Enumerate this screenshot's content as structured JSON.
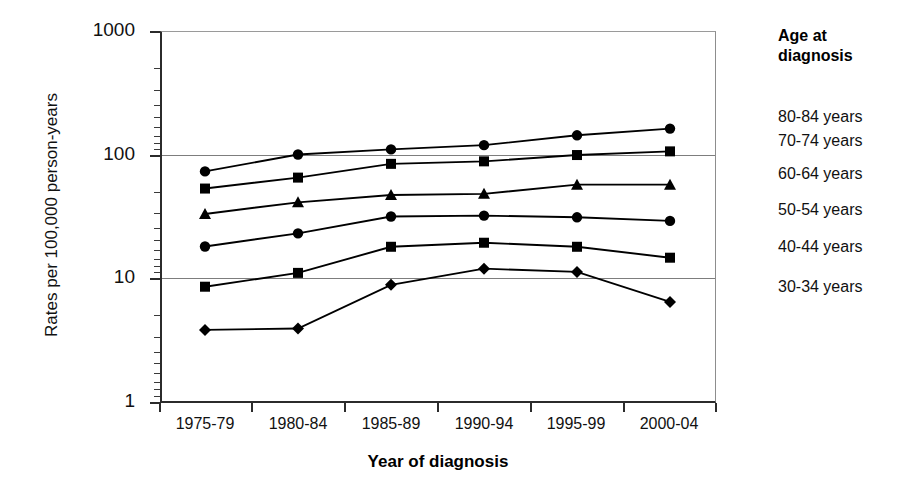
{
  "chart_data": {
    "type": "line",
    "title": "",
    "xlabel": "Year of diagnosis",
    "ylabel": "Rates per 100,000 person-years",
    "yscale": "log",
    "ylim": [
      1,
      1000
    ],
    "yticks": [
      "1000",
      "100",
      "10",
      "1"
    ],
    "grid": true,
    "legend_position": "right",
    "legend_title": "Age at diagnosis",
    "categories": [
      "1975-79",
      "1980-84",
      "1985-89",
      "1990-94",
      "1995-99",
      "2000-04"
    ],
    "series": [
      {
        "name": "80-84 years",
        "marker": "circle",
        "values": [
          73,
          100,
          110,
          119,
          143,
          162
        ]
      },
      {
        "name": "70-74 years",
        "marker": "square",
        "values": [
          53,
          65,
          84,
          88,
          99,
          106
        ]
      },
      {
        "name": "60-64 years",
        "marker": "triangle",
        "values": [
          33,
          41,
          47,
          48,
          57,
          57
        ]
      },
      {
        "name": "50-54 years",
        "marker": "circle",
        "values": [
          18,
          23,
          31.5,
          32,
          31,
          29
        ]
      },
      {
        "name": "40-44 years",
        "marker": "square",
        "values": [
          8.5,
          11,
          17.9,
          19.3,
          17.9,
          14.6
        ]
      },
      {
        "name": "30-34 years",
        "marker": "diamond",
        "values": [
          3.8,
          3.9,
          8.8,
          11.9,
          11.2,
          6.4
        ]
      }
    ]
  },
  "axis": {
    "y_title": "Rates per 100,000 person-years",
    "x_title": "Year of diagnosis",
    "y_ticks": [
      {
        "label": "1000"
      },
      {
        "label": "100"
      },
      {
        "label": "10"
      },
      {
        "label": "1"
      }
    ],
    "x_ticks": [
      {
        "label": "1975-79"
      },
      {
        "label": "1980-84"
      },
      {
        "label": "1985-89"
      },
      {
        "label": "1990-94"
      },
      {
        "label": "1995-99"
      },
      {
        "label": "2000-04"
      }
    ]
  },
  "legend": {
    "title_line1": "Age at",
    "title_line2": "diagnosis",
    "items": [
      {
        "label": "80-84 years"
      },
      {
        "label": "70-74 years"
      },
      {
        "label": "60-64 years"
      },
      {
        "label": "50-54 years"
      },
      {
        "label": "40-44 years"
      },
      {
        "label": "30-34 years"
      }
    ]
  },
  "colors": {
    "series": "#000000",
    "axis": "#2b2b2b",
    "grid": "#7d7d7d",
    "background": "#ffffff"
  }
}
